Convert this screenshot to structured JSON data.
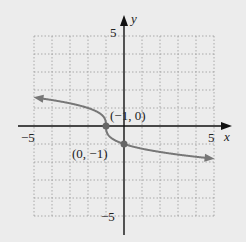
{
  "chart_data": {
    "type": "line",
    "title": "",
    "function": "y = -cbrt(x + 1)",
    "xlabel": "x",
    "ylabel": "y",
    "xlim": [
      -5,
      5
    ],
    "ylim": [
      -5,
      5
    ],
    "grid": true,
    "tick_labels": {
      "x": [
        "-5",
        "5"
      ],
      "y": [
        "5",
        "-5"
      ]
    },
    "series": [
      {
        "name": "curve",
        "x": [
          -5,
          -4,
          -3,
          -2,
          -1.5,
          -1.1,
          -1,
          -0.9,
          -0.5,
          0,
          1,
          2,
          3,
          4,
          5
        ],
        "y": [
          1.587,
          1.442,
          1.26,
          1.0,
          0.794,
          0.464,
          0,
          -0.464,
          -0.794,
          -1.0,
          -1.26,
          -1.442,
          -1.587,
          -1.71,
          -1.817
        ]
      }
    ],
    "points": [
      {
        "x": -1,
        "y": 0,
        "label": "(−1, 0)"
      },
      {
        "x": 0,
        "y": -1,
        "label": "(0, −1)"
      }
    ],
    "colors": {
      "curve": "#777777",
      "axis": "#111111",
      "grid": "#aaaaaa"
    }
  },
  "labels": {
    "x_axis": "x",
    "y_axis": "y",
    "x_min": "−5",
    "x_max": "5",
    "y_max": "5",
    "y_min": "−5",
    "point1": "(−1, 0)",
    "point2": "(0, −1)"
  }
}
